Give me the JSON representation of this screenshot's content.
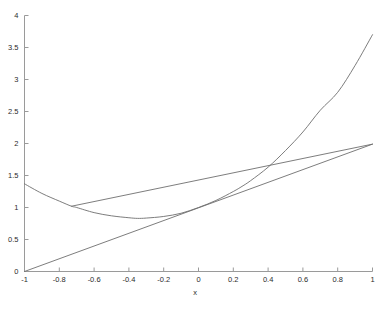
{
  "figure": {
    "background_color": "#ffffff",
    "axis_color": "#9a9a9a",
    "curve_color": "#6e6e6e",
    "tick_text_color": "#2b2b2b"
  },
  "chart_data": {
    "type": "line",
    "title": "",
    "subtitle": "",
    "xlabel": "x",
    "ylabel": "",
    "xlim": [
      -1,
      1
    ],
    "ylim": [
      0,
      4
    ],
    "grid": false,
    "legend": null,
    "xticks": [
      -1,
      -0.8,
      -0.6,
      -0.4,
      -0.2,
      0,
      0.2,
      0.4,
      0.6,
      0.8,
      1
    ],
    "xticklabels": [
      "-1",
      "-0.8",
      "-0.6",
      "-0.4",
      "-0.2",
      "0",
      "0.2",
      "0.4",
      "0.6",
      "0.8",
      "1"
    ],
    "yticks": [
      0,
      0.5,
      1,
      1.5,
      2,
      2.5,
      3,
      3.5,
      4
    ],
    "yticklabels": [
      "0",
      "0.5",
      "1",
      "1.5",
      "2",
      "2.5",
      "3",
      "3.5",
      "4"
    ],
    "series": [
      {
        "name": "convex-curve",
        "style": "solid",
        "x": [
          -1,
          -0.9,
          -0.8,
          -0.73,
          -0.7,
          -0.6,
          -0.5,
          -0.4,
          -0.35,
          -0.3,
          -0.2,
          -0.1,
          0,
          0.1,
          0.2,
          0.25,
          0.3,
          0.4,
          0.5,
          0.6,
          0.7,
          0.8,
          0.9,
          1
        ],
        "values": [
          1.37,
          1.22,
          1.1,
          1.02,
          1.0,
          0.92,
          0.87,
          0.84,
          0.83,
          0.835,
          0.86,
          0.91,
          1.0,
          1.11,
          1.25,
          1.33,
          1.42,
          1.63,
          1.89,
          2.18,
          2.52,
          2.8,
          3.22,
          3.7
        ]
      },
      {
        "name": "chord-line",
        "style": "solid",
        "x": [
          -0.73,
          1
        ],
        "values": [
          1.02,
          1.99
        ]
      },
      {
        "name": "diagonal-line",
        "style": "solid",
        "x": [
          -1,
          1
        ],
        "values": [
          0,
          1.99
        ]
      }
    ]
  },
  "axis_label": {
    "x": "x"
  }
}
